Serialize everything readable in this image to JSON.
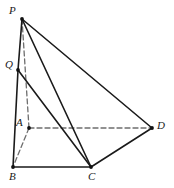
{
  "figure": {
    "kind": "geometry-diagram",
    "canvas": {
      "width": 174,
      "height": 188
    },
    "style": {
      "background_color": "#ffffff",
      "solid_stroke_color": "#1a1a1a",
      "dashed_stroke_color": "#6e6e6e",
      "solid_stroke_width": 1.6,
      "dashed_stroke_width": 1.3,
      "dash_pattern": "5,3",
      "point_color": "#111111",
      "point_radius": 1.9,
      "label_color": "#1a1a1a",
      "label_font_size": 11
    },
    "points": [
      {
        "id": "P",
        "label": "P",
        "x": 22,
        "y": 19,
        "label_x": 9,
        "label_y": 5,
        "dot": true
      },
      {
        "id": "Q",
        "label": "Q",
        "x": 18,
        "y": 70,
        "label_x": 5,
        "label_y": 59,
        "dot": true
      },
      {
        "id": "A",
        "label": "A",
        "x": 29,
        "y": 128,
        "label_x": 16,
        "label_y": 117,
        "dot": true
      },
      {
        "id": "B",
        "label": "B",
        "x": 13,
        "y": 167,
        "label_x": 9,
        "label_y": 171,
        "dot": true
      },
      {
        "id": "C",
        "label": "C",
        "x": 91,
        "y": 167,
        "label_x": 88,
        "label_y": 171,
        "dot": true
      },
      {
        "id": "D",
        "label": "D",
        "x": 152,
        "y": 128,
        "label_x": 157,
        "label_y": 120,
        "dot": true
      }
    ],
    "edges": [
      {
        "id": "PQ",
        "from": "P",
        "to": "Q",
        "style": "solid",
        "name": "edge-p-q"
      },
      {
        "id": "QB",
        "from": "Q",
        "to": "B",
        "style": "solid",
        "name": "edge-q-b"
      },
      {
        "id": "PC",
        "from": "P",
        "to": "C",
        "style": "solid",
        "name": "edge-p-c"
      },
      {
        "id": "QC",
        "from": "Q",
        "to": "C",
        "style": "solid",
        "name": "edge-q-c"
      },
      {
        "id": "PD",
        "from": "P",
        "to": "D",
        "style": "solid",
        "name": "edge-p-d"
      },
      {
        "id": "CD",
        "from": "C",
        "to": "D",
        "style": "solid",
        "name": "edge-c-d"
      },
      {
        "id": "BC",
        "from": "B",
        "to": "C",
        "style": "solid",
        "name": "edge-b-c"
      },
      {
        "id": "PA",
        "from": "P",
        "to": "A",
        "style": "dashed",
        "name": "edge-p-a-hidden"
      },
      {
        "id": "AD",
        "from": "A",
        "to": "D",
        "style": "dashed",
        "name": "edge-a-d-hidden"
      },
      {
        "id": "AB",
        "from": "A",
        "to": "B",
        "style": "dashed",
        "name": "edge-a-b-hidden"
      }
    ]
  }
}
